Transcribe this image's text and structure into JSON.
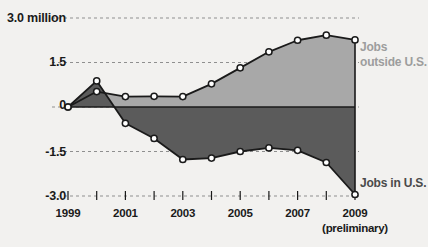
{
  "chart_data": {
    "type": "area",
    "title": "",
    "xlabel": "",
    "ylabel": "",
    "x": [
      1999,
      2000,
      2001,
      2002,
      2003,
      2004,
      2005,
      2006,
      2007,
      2008,
      2009
    ],
    "categories": [
      "1999",
      "2000",
      "2001",
      "2002",
      "2003",
      "2004",
      "2005",
      "2006",
      "2007",
      "2008",
      "2009"
    ],
    "ylim": [
      -3.0,
      3.0
    ],
    "yticks": [
      3.0,
      1.5,
      0,
      -1.5,
      -3.0
    ],
    "ytick_labels": [
      "3.0 million",
      "1.5",
      "0",
      "-1.5",
      "-3.0"
    ],
    "xticks": [
      1999,
      2000,
      2001,
      2002,
      2003,
      2004,
      2005,
      2006,
      2007,
      2008,
      2009
    ],
    "xtick_labels": [
      "1999",
      "",
      "2001",
      "",
      "2003",
      "",
      "2005",
      "",
      "2007",
      "",
      "2009"
    ],
    "x_axis_note": "(preliminary)",
    "x_axis_note_at": 2009,
    "grid": true,
    "legend_position": "right-inline",
    "series": [
      {
        "name": "Jobs outside U.S.",
        "color": "#a8a8a8",
        "line_color": "#1a1a1a",
        "marker": "open-circle",
        "values": [
          0,
          0.52,
          0.35,
          0.36,
          0.35,
          0.78,
          1.32,
          1.86,
          2.25,
          2.42,
          2.26
        ]
      },
      {
        "name": "Jobs in U.S.",
        "color": "#5b5b5b",
        "line_color": "#1a1a1a",
        "marker": "open-circle",
        "values": [
          0,
          0.88,
          -0.55,
          -1.06,
          -1.77,
          -1.72,
          -1.5,
          -1.38,
          -1.46,
          -1.87,
          -2.95
        ]
      }
    ],
    "annotations": [
      {
        "text": "Jobs outside U.S.",
        "series": "Jobs outside U.S."
      },
      {
        "text": "Jobs in U.S.",
        "series": "Jobs in U.S."
      }
    ]
  },
  "labels": {
    "y": [
      "3.0 million",
      "1.5",
      "0",
      "-1.5",
      "-3.0"
    ],
    "x": [
      "1999",
      "2001",
      "2003",
      "2005",
      "2007",
      "2009"
    ],
    "x_note": "(preliminary)",
    "series_outside_line1": "Jobs",
    "series_outside_line2": "outside U.S.",
    "series_inside": "Jobs in U.S."
  },
  "colors": {
    "background": "#f2f1ef",
    "area_outside": "#a8a8a8",
    "area_inside": "#5b5b5b",
    "line": "#1a1a1a",
    "grid": "#8f8f8f",
    "text": "#1a1a1a",
    "label_outside": "#9d9d9d",
    "label_inside": "#4a4a4a"
  }
}
